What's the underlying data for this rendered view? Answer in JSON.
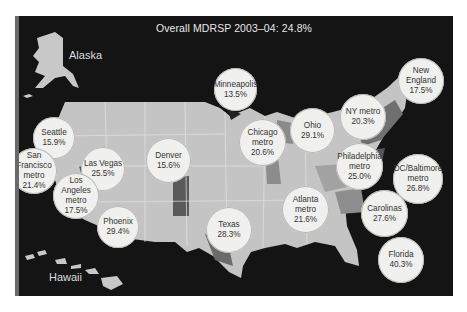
{
  "title": "Overall MDRSP 2003–04: 24.8%",
  "labels": {
    "alaska": "Alaska",
    "hawaii": "Hawaii"
  },
  "colors": {
    "background": "#141414",
    "land_light": "#c4c4c4",
    "land_mid": "#9c9c9c",
    "land_dark": "#5c5c5c",
    "bubble": "#f0f0ee"
  },
  "regions": [
    {
      "name": [
        "Seattle"
      ],
      "value": "15.9%",
      "x": 33,
      "y": 117,
      "d": 42
    },
    {
      "name": [
        "San",
        "Francisco",
        "metro"
      ],
      "value": "21.4%",
      "x": 11,
      "y": 148,
      "d": 46
    },
    {
      "name": [
        "Las Vegas"
      ],
      "value": "25.5%",
      "x": 81,
      "y": 147,
      "d": 44
    },
    {
      "name": [
        "Los",
        "Angeles",
        "metro"
      ],
      "value": "17.5%",
      "x": 53,
      "y": 173,
      "d": 46
    },
    {
      "name": [
        "Phoenix"
      ],
      "value": "29.4%",
      "x": 97,
      "y": 206,
      "d": 42
    },
    {
      "name": [
        "Denver"
      ],
      "value": "15.6%",
      "x": 146,
      "y": 138,
      "d": 45
    },
    {
      "name": [
        "Minneapolis"
      ],
      "value": "13.5%",
      "x": 214,
      "y": 68,
      "d": 43
    },
    {
      "name": [
        "Chicago",
        "metro"
      ],
      "value": "20.6%",
      "x": 239,
      "y": 119,
      "d": 47
    },
    {
      "name": [
        "Ohio"
      ],
      "value": "29.1%",
      "x": 290,
      "y": 108,
      "d": 45
    },
    {
      "name": [
        "NY metro"
      ],
      "value": "20.3%",
      "x": 340,
      "y": 94,
      "d": 46
    },
    {
      "name": [
        "New",
        "England"
      ],
      "value": "17.5%",
      "x": 398,
      "y": 58,
      "d": 46
    },
    {
      "name": [
        "Philadelphia",
        "metro"
      ],
      "value": "25.0%",
      "x": 336,
      "y": 143,
      "d": 47
    },
    {
      "name": [
        "DC/Baltimore",
        "metro"
      ],
      "value": "26.8%",
      "x": 393,
      "y": 154,
      "d": 50
    },
    {
      "name": [
        "Atlanta",
        "metro"
      ],
      "value": "21.6%",
      "x": 282,
      "y": 186,
      "d": 47
    },
    {
      "name": [
        "Carolinas"
      ],
      "value": "27.6%",
      "x": 361,
      "y": 190,
      "d": 47
    },
    {
      "name": [
        "Texas"
      ],
      "value": "28.3%",
      "x": 206,
      "y": 207,
      "d": 46
    },
    {
      "name": [
        "Florida"
      ],
      "value": "40.3%",
      "x": 378,
      "y": 237,
      "d": 46
    }
  ]
}
